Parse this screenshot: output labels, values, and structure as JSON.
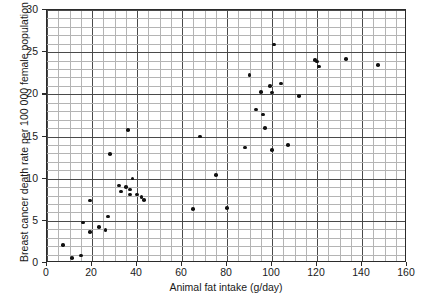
{
  "chart_data": {
    "type": "scatter",
    "title": "",
    "xlabel": "Animal fat intake (g/day)",
    "ylabel": "Breast cancer death rate per 100 000 female population",
    "xlim": [
      0,
      160
    ],
    "ylim": [
      0,
      30
    ],
    "x_major_ticks": [
      0,
      20,
      40,
      60,
      80,
      100,
      120,
      140,
      160
    ],
    "y_major_ticks": [
      0,
      5,
      10,
      15,
      20,
      25,
      30
    ],
    "x_minor_step": 5,
    "y_minor_step": 1,
    "grid": true,
    "legend": null,
    "marker": "filled-circle",
    "marker_color": "#111111",
    "points": [
      {
        "x": 7,
        "y": 2.1
      },
      {
        "x": 11,
        "y": 0.6
      },
      {
        "x": 15,
        "y": 0.9
      },
      {
        "x": 16,
        "y": 4.8
      },
      {
        "x": 19,
        "y": 3.7
      },
      {
        "x": 19,
        "y": 7.4
      },
      {
        "x": 23,
        "y": 4.3
      },
      {
        "x": 26,
        "y": 3.9
      },
      {
        "x": 27,
        "y": 5.5
      },
      {
        "x": 28,
        "y": 12.9
      },
      {
        "x": 32,
        "y": 9.2
      },
      {
        "x": 33,
        "y": 8.5
      },
      {
        "x": 35,
        "y": 9.0
      },
      {
        "x": 36,
        "y": 15.8
      },
      {
        "x": 37,
        "y": 8.7
      },
      {
        "x": 37,
        "y": 8.1
      },
      {
        "x": 38,
        "y": 10.0
      },
      {
        "x": 40,
        "y": 8.1
      },
      {
        "x": 42,
        "y": 7.8
      },
      {
        "x": 43,
        "y": 7.5
      },
      {
        "x": 65,
        "y": 6.4
      },
      {
        "x": 68,
        "y": 15.0
      },
      {
        "x": 75,
        "y": 10.4
      },
      {
        "x": 80,
        "y": 6.5
      },
      {
        "x": 88,
        "y": 13.7
      },
      {
        "x": 90,
        "y": 22.3
      },
      {
        "x": 93,
        "y": 18.2
      },
      {
        "x": 95,
        "y": 20.3
      },
      {
        "x": 96,
        "y": 17.6
      },
      {
        "x": 97,
        "y": 16.0
      },
      {
        "x": 99,
        "y": 21.0
      },
      {
        "x": 100,
        "y": 20.2
      },
      {
        "x": 100,
        "y": 13.4
      },
      {
        "x": 101,
        "y": 25.9
      },
      {
        "x": 104,
        "y": 21.3
      },
      {
        "x": 107,
        "y": 14.0
      },
      {
        "x": 112,
        "y": 19.8
      },
      {
        "x": 119,
        "y": 24.1
      },
      {
        "x": 120,
        "y": 23.9
      },
      {
        "x": 121,
        "y": 23.3
      },
      {
        "x": 133,
        "y": 24.2
      },
      {
        "x": 147,
        "y": 23.5
      }
    ]
  },
  "axis": {
    "x_tick_labels": [
      "0",
      "20",
      "40",
      "60",
      "80",
      "100",
      "120",
      "140",
      "160"
    ],
    "y_tick_labels": [
      "0",
      "5",
      "10",
      "15",
      "20",
      "25",
      "30"
    ]
  }
}
